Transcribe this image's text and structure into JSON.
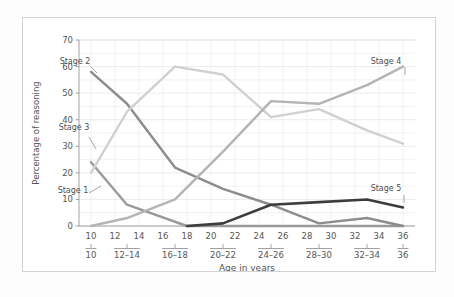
{
  "chart_data": {
    "type": "line",
    "title": "",
    "xlabel": "Age in years",
    "ylabel": "Percentage of reasoning",
    "xlim": [
      9,
      37
    ],
    "ylim": [
      0,
      70
    ],
    "grid": true,
    "legend_position": "inline-labels",
    "y_ticks": [
      0,
      10,
      20,
      30,
      40,
      50,
      60,
      70
    ],
    "y_tick_labels": [
      "0",
      "10",
      "20",
      "30",
      "40",
      "50",
      "60",
      "70"
    ],
    "y_gridline_step": 5,
    "x_ticks": [
      10,
      12,
      14,
      16,
      18,
      20,
      22,
      24,
      26,
      28,
      30,
      32,
      34,
      36
    ],
    "x_tick_labels": [
      "10",
      "12",
      "14",
      "16",
      "18",
      "20",
      "22",
      "24",
      "26",
      "28",
      "30",
      "32",
      "34",
      "36"
    ],
    "x_groups": [
      {
        "label": "10",
        "center": 10
      },
      {
        "label": "12–14",
        "center": 13
      },
      {
        "label": "16–18",
        "center": 17
      },
      {
        "label": "20–22",
        "center": 21
      },
      {
        "label": "24–26",
        "center": 25
      },
      {
        "label": "28–30",
        "center": 29
      },
      {
        "label": "32–34",
        "center": 33
      },
      {
        "label": "36",
        "center": 36
      }
    ],
    "series": [
      {
        "name": "Stage 1",
        "color": "#9a9a9a",
        "label_text": "Stage 1",
        "x": [
          10,
          13,
          18,
          25,
          29,
          33,
          36
        ],
        "values": [
          24,
          8,
          0,
          0,
          0,
          0,
          0
        ]
      },
      {
        "name": "Stage 2",
        "color": "#8c8c8c",
        "label_text": "Stage 2",
        "x": [
          10,
          13,
          17,
          21,
          25,
          29,
          33,
          36
        ],
        "values": [
          58,
          46,
          22,
          14,
          8,
          1,
          3,
          0
        ]
      },
      {
        "name": "Stage 3",
        "color": "#d0d0d0",
        "label_text": "Stage 3",
        "x": [
          10,
          13,
          17,
          21,
          25,
          29,
          33,
          36
        ],
        "values": [
          20,
          43,
          60,
          57,
          41,
          44,
          36,
          31
        ]
      },
      {
        "name": "Stage 4",
        "color": "#b4b4b4",
        "label_text": "Stage 4",
        "x": [
          10,
          13,
          17,
          21,
          25,
          29,
          33,
          36
        ],
        "values": [
          0,
          3,
          10,
          28,
          47,
          46,
          53,
          60
        ]
      },
      {
        "name": "Stage 5",
        "color": "#3d3d3d",
        "label_text": "Stage 5",
        "x": [
          18,
          21,
          25,
          29,
          33,
          36
        ],
        "values": [
          0,
          1,
          8,
          9,
          10,
          7
        ]
      }
    ],
    "annotations": [
      {
        "text": "Stage 2",
        "x_px": 74,
        "y_px": 63
      },
      {
        "text": "Stage 3",
        "x_px": 73,
        "y_px": 129
      },
      {
        "text": "Stage 1",
        "x_px": 72,
        "y_px": 192
      },
      {
        "text": "Stage 4",
        "x_px": 385,
        "y_px": 63
      },
      {
        "text": "Stage 5",
        "x_px": 385,
        "y_px": 190
      }
    ]
  },
  "axes": {
    "y_title": "Percentage of reasoning",
    "x_title": "Age in years"
  }
}
